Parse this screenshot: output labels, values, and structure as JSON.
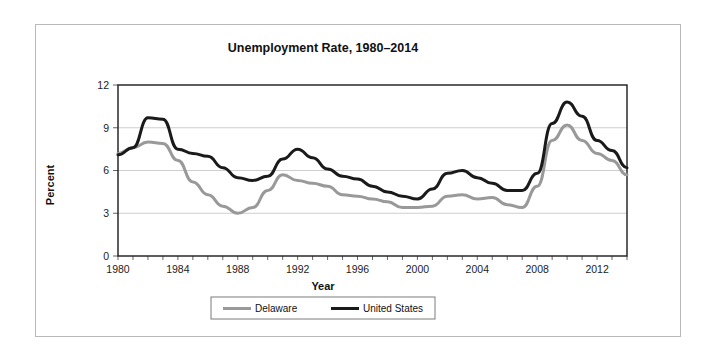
{
  "chart_data": {
    "type": "line",
    "title": "Unemployment Rate, 1980–2014",
    "xlabel": "Year",
    "ylabel": "Percent",
    "xlim": [
      1980,
      2014
    ],
    "ylim": [
      0,
      12
    ],
    "yticks": [
      0,
      3,
      6,
      9,
      12
    ],
    "xticks": [
      1980,
      1984,
      1988,
      1992,
      1996,
      2000,
      2004,
      2008,
      2012
    ],
    "xtick_labels": [
      "1980",
      "1984",
      "1988",
      "1992",
      "1996",
      "2000",
      "2004",
      "2008",
      "2012"
    ],
    "ytick_labels": [
      "0",
      "3",
      "6",
      "9",
      "12"
    ],
    "x_minor_tick_step": 1,
    "grid": "horizontal",
    "legend_position": "bottom-outside",
    "x": [
      1980,
      1981,
      1982,
      1983,
      1984,
      1985,
      1986,
      1987,
      1988,
      1989,
      1990,
      1991,
      1992,
      1993,
      1994,
      1995,
      1996,
      1997,
      1998,
      1999,
      2000,
      2001,
      2002,
      2003,
      2004,
      2005,
      2006,
      2007,
      2008,
      2009,
      2010,
      2011,
      2012,
      2013,
      2014
    ],
    "series": [
      {
        "name": "Delaware",
        "color": "#999999",
        "width": 3.0,
        "values": [
          7.2,
          7.6,
          8.0,
          7.9,
          6.7,
          5.2,
          4.3,
          3.5,
          3.0,
          3.4,
          4.6,
          5.7,
          5.3,
          5.1,
          4.9,
          4.3,
          4.2,
          4.0,
          3.8,
          3.4,
          3.4,
          3.5,
          4.2,
          4.3,
          4.0,
          4.1,
          3.6,
          3.4,
          4.9,
          8.1,
          9.2,
          8.1,
          7.2,
          6.7,
          5.7
        ]
      },
      {
        "name": "United States",
        "color": "#1a1a1a",
        "width": 3.0,
        "values": [
          7.1,
          7.6,
          9.7,
          9.6,
          7.5,
          7.2,
          7.0,
          6.2,
          5.5,
          5.3,
          5.6,
          6.8,
          7.5,
          6.9,
          6.1,
          5.6,
          5.4,
          4.9,
          4.5,
          4.2,
          4.0,
          4.7,
          5.8,
          6.0,
          5.5,
          5.1,
          4.6,
          4.6,
          5.8,
          9.3,
          10.8,
          9.8,
          8.1,
          7.4,
          6.2
        ]
      }
    ],
    "legend": [
      {
        "label": "Delaware",
        "color": "#999999"
      },
      {
        "label": "United States",
        "color": "#1a1a1a"
      }
    ]
  }
}
